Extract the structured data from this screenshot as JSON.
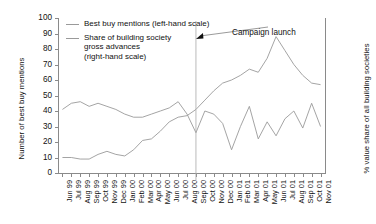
{
  "chart_data": {
    "type": "line",
    "title": "",
    "xlabel": "",
    "ylabel": "Number of best buy mentions",
    "ylabel_right": "% value share of all building societies",
    "ylim": [
      0,
      100
    ],
    "yticks": [
      0,
      10,
      20,
      30,
      40,
      50,
      60,
      70,
      80,
      90,
      100
    ],
    "ylim_right": [
      0,
      100
    ],
    "yticks_right": [],
    "grid": false,
    "legend_position": "top-left",
    "categories": [
      "Jun 99",
      "Jul 99",
      "Aug 99",
      "Sep 99",
      "Oct 99",
      "Nov 99",
      "Dec 99",
      "Jan 00",
      "Feb 00",
      "Mar 00",
      "Apr 00",
      "May 00",
      "Jun 00",
      "Jul 00",
      "Aug 00",
      "Sep 00",
      "Oct 00",
      "Nov 00",
      "Dec 00",
      "Jan 01",
      "Feb 01",
      "Mar 01",
      "Apr 01",
      "May 01",
      "Jun 01",
      "Jul 01",
      "Aug 01",
      "Sep 01",
      "Oct 01",
      "Nov 01"
    ],
    "series": [
      {
        "name": "Best buy mentions (left-hand scale)",
        "axis": "left",
        "color": "#9a9a9a",
        "values": [
          10,
          10,
          9,
          9,
          12,
          14,
          12,
          11,
          15,
          21,
          22,
          27,
          33,
          36,
          37,
          41,
          47,
          53,
          58,
          60,
          63,
          67,
          65,
          74,
          88,
          79,
          70,
          63,
          58,
          57
        ]
      },
      {
        "name": "Share of building society gross advances (right-hand scale)",
        "axis": "right",
        "color": "#9a9a9a",
        "values": [
          41,
          45,
          46,
          43,
          45,
          43,
          41,
          38,
          36,
          36,
          38,
          40,
          42,
          46,
          38,
          26,
          40,
          38,
          32,
          15,
          30,
          43,
          22,
          33,
          24,
          35,
          40,
          29,
          45,
          30
        ]
      }
    ],
    "annotations": [
      {
        "text": "Campaign launch",
        "at_category": "Sep 00"
      }
    ]
  },
  "legend": {
    "items": [
      {
        "label": "Best buy mentions (left-hand scale)"
      },
      {
        "label": "Share of building society\ngross advances\n(right-hand scale)"
      }
    ]
  },
  "axes": {
    "left_title": "Number of best buy mentions",
    "right_title": "% value share of all building societies"
  }
}
